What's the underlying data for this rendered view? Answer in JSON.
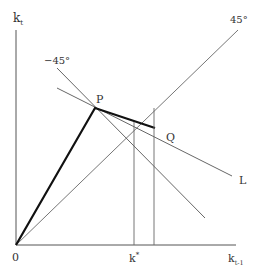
{
  "diagram": {
    "axes": {
      "y_label": "k",
      "y_label_sub": "t",
      "x_label": "k",
      "x_label_sub": "t-1",
      "origin_label": "0"
    },
    "lines": {
      "line_45_label": "45°",
      "line_minus45_label": "−45°",
      "line_L_label": "L"
    },
    "points": {
      "P_label": "P",
      "Q_label": "Q"
    },
    "ticks": {
      "k_star_label": "k",
      "k_star_sup": "*"
    },
    "colors": {
      "line": "#555555",
      "thick_line": "#111111",
      "text": "#333333"
    }
  }
}
